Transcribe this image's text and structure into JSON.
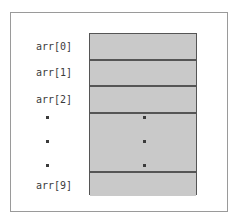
{
  "figure": {
    "kind": "array-index-diagram",
    "caption": "",
    "colors": {
      "cell_fill": "#c9c9c9",
      "cell_border": "#555555",
      "frame_border": "#9a9a9a",
      "text": "#3b3b3b",
      "background": "#ffffff"
    }
  },
  "array": {
    "name": "arr",
    "length_label": "10",
    "labels": {
      "index_0": "arr[0]",
      "index_1": "arr[1]",
      "index_2": "arr[2]",
      "index_9": "arr[9]"
    },
    "cells": [
      {
        "id": "cell-0",
        "label": "arr[0]",
        "value": ""
      },
      {
        "id": "cell-1",
        "label": "arr[1]",
        "value": ""
      },
      {
        "id": "cell-2",
        "label": "arr[2]",
        "value": ""
      },
      {
        "id": "cell-gap",
        "label": "",
        "value": ""
      },
      {
        "id": "cell-9",
        "label": "arr[9]",
        "value": ""
      }
    ],
    "ellipsis": {
      "glyph": "·",
      "count": 3,
      "meaning": "elided elements"
    }
  }
}
